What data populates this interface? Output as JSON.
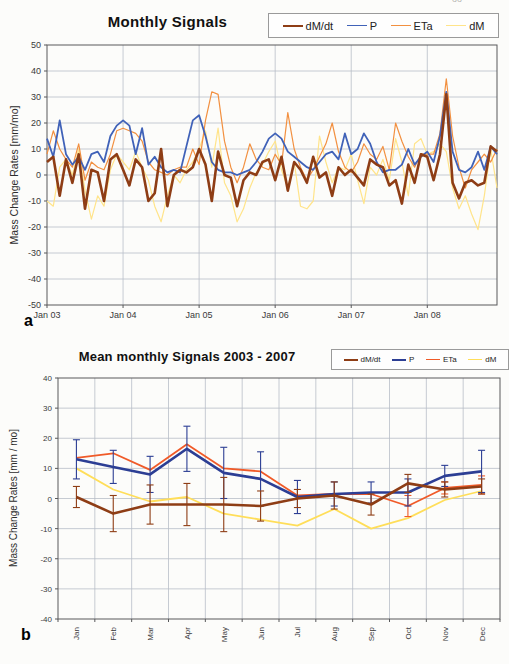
{
  "page": {
    "page_fragment": "oo",
    "panel_a_label": "a",
    "panel_b_label": "b"
  },
  "colors": {
    "grid": "#b8bec8",
    "border": "#58595b",
    "tick_text": "#3a3a3a",
    "dMdt": "#8e3d15",
    "P_top": "#4062b8",
    "P_bottom": "#2c3e94",
    "ETa_top": "#f29040",
    "ETa_bottom": "#f05a28",
    "dM_top": "#ffe48a",
    "dM_bottom": "#ffde59"
  },
  "chart_data": [
    {
      "type": "line",
      "title": "Monthly Signals",
      "xlabel": "",
      "ylabel": "Mass Change Rates  [mm/mo]",
      "ylim": [
        -50,
        50
      ],
      "ystep": 10,
      "grid": true,
      "legend_position": "top-right",
      "x_tick_labels": [
        "Jan 03",
        "Jan 04",
        "Jan 05",
        "Jan 06",
        "Jan 07",
        "Jan 08"
      ],
      "months_per_tick": 12,
      "n_points": 72,
      "legend": [
        "dM/dt",
        "P",
        "ETa",
        "dM"
      ],
      "series": [
        {
          "name": "dM/dt",
          "color": "#8e3d15",
          "width": 2.6,
          "values": [
            5,
            7,
            -8,
            6,
            -3,
            8,
            -13,
            2,
            1,
            -10,
            6,
            8,
            2,
            -4,
            6,
            3,
            -10,
            -7,
            10,
            -12,
            0,
            2,
            1,
            3,
            10,
            4,
            -10,
            9,
            0,
            -1,
            -12,
            -2,
            1,
            0,
            5,
            6,
            -2,
            7,
            -6,
            5,
            2,
            -3,
            7,
            -1,
            1,
            -8,
            3,
            0,
            2,
            -1,
            -4,
            6,
            4,
            3,
            -4,
            -2,
            -11,
            4,
            -3,
            8,
            7,
            -2,
            8,
            31,
            -3,
            -9,
            -3,
            -2,
            -4,
            -3,
            11,
            9
          ]
        },
        {
          "name": "P",
          "color": "#4062b8",
          "width": 1.8,
          "values": [
            14,
            7,
            21,
            8,
            4,
            7,
            2,
            8,
            9,
            5,
            15,
            19,
            21,
            19,
            8,
            18,
            4,
            7,
            3,
            1,
            2,
            1,
            11,
            21,
            23,
            15,
            5,
            2,
            1,
            1,
            0,
            1,
            2,
            5,
            9,
            14,
            16,
            14,
            9,
            7,
            5,
            3,
            2,
            5,
            8,
            9,
            6,
            16,
            8,
            10,
            16,
            12,
            5,
            1,
            2,
            2,
            4,
            10,
            4,
            7,
            9,
            5,
            15,
            32,
            9,
            2,
            1,
            3,
            9,
            2,
            11,
            8
          ]
        },
        {
          "name": "ETa",
          "color": "#f29040",
          "width": 1.2,
          "values": [
            8,
            17,
            10,
            6,
            3,
            12,
            -2,
            5,
            3,
            2,
            8,
            17,
            18,
            17,
            16,
            13,
            5,
            2,
            1,
            0,
            2,
            3,
            3,
            10,
            4,
            21,
            32,
            31,
            13,
            3,
            -3,
            3,
            12,
            6,
            3,
            2,
            8,
            4,
            24,
            10,
            3,
            -2,
            2,
            7,
            12,
            20,
            9,
            3,
            1,
            5,
            12,
            8,
            6,
            11,
            2,
            20,
            13,
            7,
            3,
            8,
            8,
            8,
            16,
            37,
            15,
            3,
            -5,
            2,
            5,
            8,
            5,
            10
          ]
        },
        {
          "name": "dM",
          "color": "#ffe48a",
          "width": 1.2,
          "values": [
            -10,
            -12,
            3,
            6,
            0,
            10,
            -6,
            -17,
            -8,
            -12,
            2,
            8,
            5,
            2,
            9,
            3,
            -2,
            -12,
            -18,
            -8,
            0,
            -3,
            2,
            5,
            10,
            17,
            3,
            18,
            -3,
            -8,
            -18,
            -13,
            -5,
            1,
            4,
            9,
            13,
            2,
            -5,
            5,
            -12,
            -13,
            -10,
            15,
            5,
            -3,
            3,
            2,
            8,
            -2,
            -11,
            3,
            0,
            6,
            -2,
            14,
            5,
            -8,
            12,
            14,
            8,
            9,
            12,
            9,
            -5,
            -13,
            -8,
            -15,
            -21,
            -8,
            10,
            -5
          ]
        }
      ]
    },
    {
      "type": "line",
      "title": "Mean monthly Signals  2003 - 2007",
      "xlabel": "",
      "ylabel": "Mass Change Rates  [mm / mo]",
      "ylim": [
        -40,
        40
      ],
      "ystep": 10,
      "grid": true,
      "error_bars": true,
      "legend_position": "top-right",
      "categories": [
        "Jan",
        "Feb",
        "Mar",
        "Apr",
        "May",
        "Jun",
        "Jul",
        "Aug",
        "Sep",
        "Oct",
        "Nov",
        "Dec"
      ],
      "legend": [
        "dM/dt",
        "P",
        "ETa",
        "dM"
      ],
      "series": [
        {
          "name": "dM/dt",
          "color": "#8e3d15",
          "width": 2.6,
          "values": [
            0.5,
            -5,
            -2,
            -2,
            -2,
            -2.5,
            0,
            1,
            -2,
            5,
            3,
            4
          ],
          "err": [
            3.5,
            6,
            6.5,
            7,
            9,
            5,
            3,
            4.5,
            3.5,
            3,
            2.5,
            2.5
          ]
        },
        {
          "name": "P",
          "color": "#2c3e94",
          "width": 2.6,
          "values": [
            13,
            10.5,
            8,
            16.5,
            8.5,
            6.5,
            0.5,
            1.5,
            2,
            2,
            7.5,
            9
          ],
          "err": [
            6.5,
            5.5,
            6,
            7.5,
            8.5,
            9,
            5.5,
            4,
            3.5,
            4.5,
            3.5,
            7
          ]
        },
        {
          "name": "ETa",
          "color": "#f05a28",
          "width": 1.8,
          "values": [
            13.5,
            15,
            9.5,
            18,
            10,
            9,
            1,
            1.5,
            1.5,
            -2.5,
            3.5,
            4.5
          ],
          "err": [
            null,
            null,
            null,
            null,
            null,
            null,
            null,
            null,
            null,
            3.5,
            2,
            3
          ]
        },
        {
          "name": "dM",
          "color": "#ffde59",
          "width": 1.8,
          "values": [
            10,
            3,
            -1,
            0.5,
            -5,
            -7,
            -9,
            -3.5,
            -10,
            -6.5,
            -0.5,
            2.5
          ],
          "err": []
        }
      ]
    }
  ]
}
